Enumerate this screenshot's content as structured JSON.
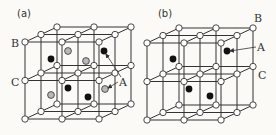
{
  "figure": {
    "background": "#fbfaf6",
    "line_color": "#333333",
    "node_fill": "#ffffff",
    "black_atom": "#111111",
    "gray_atom": "#b8b8b8",
    "geometry": {
      "col_step": [
        37,
        0
      ],
      "depth_step": [
        16,
        -7.5
      ],
      "level_step": [
        0,
        -38.5
      ],
      "node_radius": 3.2,
      "atom_radius": 3.4
    },
    "panels": [
      {
        "id": "a",
        "caption": "(a)",
        "caption_pos": [
          24,
          17
        ],
        "origin": [
          25,
          119
        ],
        "atoms": [
          {
            "type": "gray",
            "x": 68,
            "y": 51
          },
          {
            "type": "black",
            "x": 51,
            "y": 59
          },
          {
            "type": "gray",
            "x": 86,
            "y": 61
          },
          {
            "type": "black",
            "x": 104,
            "y": 51
          },
          {
            "type": "gray",
            "x": 51,
            "y": 95
          },
          {
            "type": "black",
            "x": 68,
            "y": 88
          },
          {
            "type": "black",
            "x": 88,
            "y": 97
          },
          {
            "type": "gray",
            "x": 105,
            "y": 89
          }
        ],
        "labels": [
          {
            "text": "B",
            "x": 11,
            "y": 47
          },
          {
            "text": "C",
            "x": 11,
            "y": 86
          },
          {
            "text": "A",
            "x": 119,
            "y": 86
          }
        ],
        "arrows": [
          {
            "from": [
              121,
              77
            ],
            "to": [
              106,
              54
            ]
          },
          {
            "from": [
              118,
              82
            ],
            "to": [
              108,
              88
            ]
          }
        ]
      },
      {
        "id": "b",
        "caption": "(b)",
        "caption_pos": [
          165,
          17
        ],
        "origin": [
          147,
          120
        ],
        "atoms": [
          {
            "type": "black",
            "x": 227,
            "y": 51
          },
          {
            "type": "black",
            "x": 173,
            "y": 59
          },
          {
            "type": "black",
            "x": 189,
            "y": 89
          },
          {
            "type": "black",
            "x": 210,
            "y": 96
          }
        ],
        "labels": [
          {
            "text": "B",
            "x": 254,
            "y": 22
          },
          {
            "text": "A",
            "x": 257,
            "y": 51
          },
          {
            "text": "C",
            "x": 258,
            "y": 79
          }
        ],
        "arrows": [
          {
            "from": [
              256,
              47
            ],
            "to": [
              230,
              51
            ]
          }
        ]
      }
    ]
  }
}
